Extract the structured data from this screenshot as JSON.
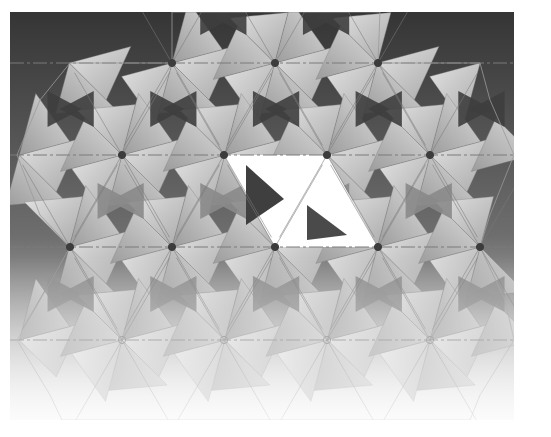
{
  "diagram": {
    "title": "",
    "type": "origami triangle-twist tessellation (folded pattern render)",
    "canvas": {
      "width": 551,
      "height": 437,
      "page_color": "#ffffff"
    },
    "frame": {
      "x": 10,
      "y": 12,
      "width": 504,
      "height": 408
    },
    "colors": {
      "bg_top": "#353535",
      "bg_mid": "#6e6e6e",
      "bg_bottom": "#f2f2f2",
      "panel_light": "#d4d4d4",
      "panel_mid": "#b5b5b5",
      "panel_dark": "#8d8d8d",
      "highlight": "#ffffff",
      "crease": "#7a7a7a",
      "node": "#3c3c3c"
    },
    "crease_lines_y": [
      63,
      155,
      247,
      340
    ],
    "lattice": {
      "dx": 102.7,
      "rows": [
        {
          "y": 63,
          "xs": [
            172,
            275,
            378
          ]
        },
        {
          "y": 155,
          "xs": [
            70,
            122,
            224,
            327,
            430
          ]
        },
        {
          "y": 247,
          "xs": [
            70,
            172,
            275,
            378,
            480
          ]
        },
        {
          "y": 340,
          "xs": [
            17,
            122,
            224,
            327,
            430,
            507
          ]
        }
      ]
    },
    "nodes": [
      {
        "x": 172,
        "y": 63,
        "style": "filled"
      },
      {
        "x": 275,
        "y": 63,
        "style": "filled"
      },
      {
        "x": 378,
        "y": 63,
        "style": "filled"
      },
      {
        "x": 122,
        "y": 155,
        "style": "filled"
      },
      {
        "x": 224,
        "y": 155,
        "style": "filled"
      },
      {
        "x": 327,
        "y": 155,
        "style": "filled"
      },
      {
        "x": 430,
        "y": 155,
        "style": "filled"
      },
      {
        "x": 70,
        "y": 247,
        "style": "filled"
      },
      {
        "x": 172,
        "y": 247,
        "style": "filled"
      },
      {
        "x": 275,
        "y": 247,
        "style": "filled"
      },
      {
        "x": 378,
        "y": 247,
        "style": "filled"
      },
      {
        "x": 480,
        "y": 247,
        "style": "filled"
      },
      {
        "x": 122,
        "y": 340,
        "style": "hollow"
      },
      {
        "x": 224,
        "y": 340,
        "style": "hollow"
      },
      {
        "x": 327,
        "y": 340,
        "style": "hollow"
      },
      {
        "x": 430,
        "y": 340,
        "style": "hollow"
      }
    ],
    "highlight_region": {
      "description": "white parallelogram of two triangles between nodes",
      "points": [
        [
          224,
          155
        ],
        [
          327,
          155
        ],
        [
          378,
          247
        ],
        [
          275,
          247
        ]
      ]
    },
    "outline_polygon": [
      [
        172,
        12
      ],
      [
        216,
        12
      ],
      [
        275,
        12
      ],
      [
        332,
        12
      ],
      [
        380,
        12
      ],
      [
        378,
        63
      ],
      [
        480,
        63
      ],
      [
        490,
        100
      ],
      [
        514,
        155
      ],
      [
        490,
        215
      ],
      [
        480,
        247
      ],
      [
        505,
        300
      ],
      [
        514,
        340
      ],
      [
        480,
        395
      ],
      [
        470,
        420
      ],
      [
        62,
        420
      ],
      [
        50,
        395
      ],
      [
        17,
        340
      ],
      [
        40,
        300
      ],
      [
        70,
        247
      ],
      [
        40,
        215
      ],
      [
        17,
        155
      ],
      [
        40,
        100
      ],
      [
        70,
        63
      ],
      [
        172,
        63
      ]
    ]
  }
}
